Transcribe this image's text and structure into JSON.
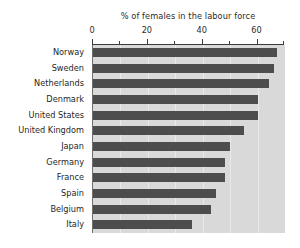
{
  "chart_data": {
    "type": "bar",
    "orientation": "horizontal",
    "title": "% of females in the labour force",
    "xlabel": "",
    "ylabel": "",
    "xlim": [
      0,
      70
    ],
    "grid": true,
    "legend": null,
    "axis_position": "top",
    "categories": [
      "Norway",
      "Sweden",
      "Netherlands",
      "Denmark",
      "United States",
      "United Kingdom",
      "Japan",
      "Germany",
      "France",
      "Spain",
      "Belgium",
      "Italy"
    ],
    "values": [
      67,
      66,
      64,
      60,
      60,
      55,
      50,
      48,
      48,
      45,
      43,
      36
    ],
    "tick_labels_major": [
      "0",
      "20",
      "40",
      "60"
    ],
    "tick_values_major": [
      0,
      20,
      40,
      60
    ],
    "tick_values_minor": [
      10,
      30,
      50,
      70
    ],
    "colors": {
      "bar": "#4d4d4d",
      "plot_background": "#d9d9d9",
      "page_background": "#ffffff",
      "axis": "#3a3a3a",
      "gridline": "#e9e9e9",
      "text": "#1f1f1f"
    }
  }
}
